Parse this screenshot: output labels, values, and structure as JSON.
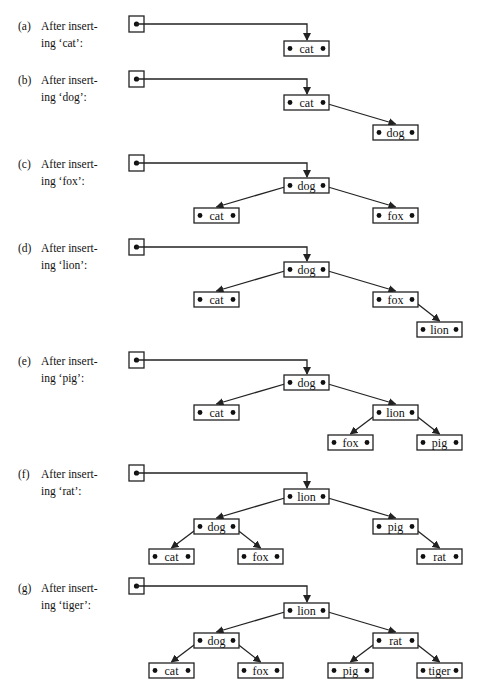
{
  "figure": {
    "colors": {
      "line": "#222222",
      "text": "#111111",
      "background": "#ffffff"
    },
    "node_box": {
      "width": 45,
      "height": 15
    },
    "root_box": {
      "x": 129,
      "width": 15,
      "height": 16
    },
    "panels": [
      {
        "id": "a",
        "tag": "(a)",
        "line1": "After insert-",
        "line2": "ing ‘cat’:",
        "label_top": 18,
        "root_y": 16,
        "nodes": [
          {
            "key": "cat",
            "x": 284,
            "y": 41
          }
        ],
        "edges": []
      },
      {
        "id": "b",
        "tag": "(b)",
        "line1": "After insert-",
        "line2": "ing ‘dog’:",
        "label_top": 72,
        "root_y": 71,
        "nodes": [
          {
            "key": "cat",
            "x": 284,
            "y": 95
          },
          {
            "key": "dog",
            "x": 373,
            "y": 125
          }
        ],
        "edges": [
          {
            "from": 0,
            "to": 1,
            "side": "right"
          }
        ]
      },
      {
        "id": "c",
        "tag": "(c)",
        "line1": "After insert-",
        "line2": "ing ‘fox’:",
        "label_top": 156,
        "root_y": 155,
        "nodes": [
          {
            "key": "dog",
            "x": 284,
            "y": 178
          },
          {
            "key": "cat",
            "x": 194,
            "y": 208
          },
          {
            "key": "fox",
            "x": 373,
            "y": 208
          }
        ],
        "edges": [
          {
            "from": 0,
            "to": 1,
            "side": "left"
          },
          {
            "from": 0,
            "to": 2,
            "side": "right"
          }
        ]
      },
      {
        "id": "d",
        "tag": "(d)",
        "line1": "After insert-",
        "line2": "ing ‘lion’:",
        "label_top": 240,
        "root_y": 239,
        "nodes": [
          {
            "key": "dog",
            "x": 284,
            "y": 262
          },
          {
            "key": "cat",
            "x": 194,
            "y": 292
          },
          {
            "key": "fox",
            "x": 373,
            "y": 292
          },
          {
            "key": "lion",
            "x": 417,
            "y": 322
          }
        ],
        "edges": [
          {
            "from": 0,
            "to": 1,
            "side": "left"
          },
          {
            "from": 0,
            "to": 2,
            "side": "right"
          },
          {
            "from": 2,
            "to": 3,
            "side": "right"
          }
        ]
      },
      {
        "id": "e",
        "tag": "(e)",
        "line1": "After insert-",
        "line2": "ing ‘pig’:",
        "label_top": 353,
        "root_y": 352,
        "nodes": [
          {
            "key": "dog",
            "x": 284,
            "y": 375
          },
          {
            "key": "cat",
            "x": 194,
            "y": 405
          },
          {
            "key": "lion",
            "x": 373,
            "y": 405
          },
          {
            "key": "fox",
            "x": 328,
            "y": 435
          },
          {
            "key": "pig",
            "x": 417,
            "y": 435
          }
        ],
        "edges": [
          {
            "from": 0,
            "to": 1,
            "side": "left"
          },
          {
            "from": 0,
            "to": 2,
            "side": "right"
          },
          {
            "from": 2,
            "to": 3,
            "side": "left"
          },
          {
            "from": 2,
            "to": 4,
            "side": "right"
          }
        ]
      },
      {
        "id": "f",
        "tag": "(f)",
        "line1": "After insert-",
        "line2": "ing ‘rat’:",
        "label_top": 466,
        "root_y": 465,
        "nodes": [
          {
            "key": "lion",
            "x": 284,
            "y": 489
          },
          {
            "key": "dog",
            "x": 194,
            "y": 519
          },
          {
            "key": "pig",
            "x": 373,
            "y": 519
          },
          {
            "key": "cat",
            "x": 149,
            "y": 549
          },
          {
            "key": "fox",
            "x": 238,
            "y": 549
          },
          {
            "key": "rat",
            "x": 417,
            "y": 549
          }
        ],
        "edges": [
          {
            "from": 0,
            "to": 1,
            "side": "left"
          },
          {
            "from": 0,
            "to": 2,
            "side": "right"
          },
          {
            "from": 1,
            "to": 3,
            "side": "left"
          },
          {
            "from": 1,
            "to": 4,
            "side": "right"
          },
          {
            "from": 2,
            "to": 5,
            "side": "right"
          }
        ]
      },
      {
        "id": "g",
        "tag": "(g)",
        "line1": "After insert-",
        "line2": "ing ‘tiger’:",
        "label_top": 580,
        "root_y": 578,
        "nodes": [
          {
            "key": "lion",
            "x": 284,
            "y": 603
          },
          {
            "key": "dog",
            "x": 194,
            "y": 633
          },
          {
            "key": "rat",
            "x": 373,
            "y": 633
          },
          {
            "key": "cat",
            "x": 149,
            "y": 663
          },
          {
            "key": "fox",
            "x": 238,
            "y": 663
          },
          {
            "key": "pig",
            "x": 328,
            "y": 663
          },
          {
            "key": "tiger",
            "x": 417,
            "y": 663
          }
        ],
        "edges": [
          {
            "from": 0,
            "to": 1,
            "side": "left"
          },
          {
            "from": 0,
            "to": 2,
            "side": "right"
          },
          {
            "from": 1,
            "to": 3,
            "side": "left"
          },
          {
            "from": 1,
            "to": 4,
            "side": "right"
          },
          {
            "from": 2,
            "to": 5,
            "side": "left"
          },
          {
            "from": 2,
            "to": 6,
            "side": "right"
          }
        ]
      }
    ]
  }
}
